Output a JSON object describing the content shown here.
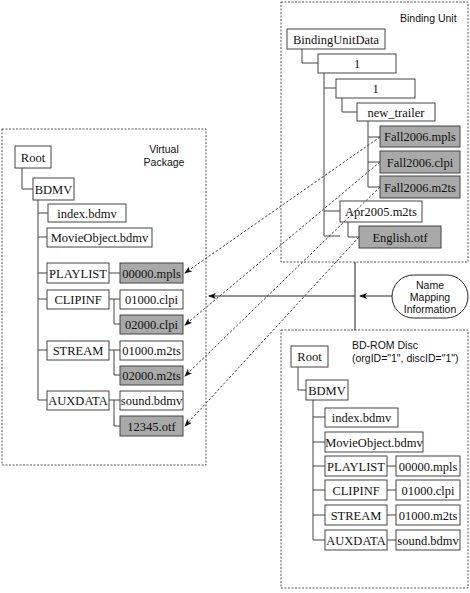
{
  "colors": {
    "shaded_box": "#a9a9a9",
    "plain_box": "#ffffff",
    "line": "#444444"
  },
  "binding_unit": {
    "title": "Binding Unit",
    "nodes": {
      "root": "BindingUnitData",
      "org": "1",
      "disc": "1",
      "dir": "new_trailer",
      "mpls": "Fall2006.mpls",
      "clpi": "Fall2006.clpi",
      "m2ts": "Fall2006.m2ts",
      "apr": "Apr2005.m2ts",
      "otf": "English.otf"
    }
  },
  "virtual_package": {
    "title_line1": "Virtual",
    "title_line2": "Package",
    "nodes": {
      "root": "Root",
      "bdmv": "BDMV",
      "index": "index.bdmv",
      "movieobject": "MovieObject.bdmv",
      "playlist": "PLAYLIST",
      "mpls": "00000.mpls",
      "clipinf": "CLIPINF",
      "clpi1": "01000.clpi",
      "clpi2": "02000.clpi",
      "stream": "STREAM",
      "m2ts1": "01000.m2ts",
      "m2ts2": "02000.m2ts",
      "auxdata": "AUXDATA",
      "sound": "sound.bdmv",
      "otf": "12345.otf"
    }
  },
  "name_mapping": {
    "line1": "Name",
    "line2": "Mapping",
    "line3": "Information"
  },
  "bdrom_disc": {
    "title_line1": "BD-ROM Disc",
    "title_line2": "(orgID=\"1\", discID=\"1\")",
    "nodes": {
      "root": "Root",
      "bdmv": "BDMV",
      "index": "index.bdmv",
      "movieobject": "MovieObject.bdmv",
      "playlist": "PLAYLIST",
      "mpls": "00000.mpls",
      "clipinf": "CLIPINF",
      "clpi": "01000.clpi",
      "stream": "STREAM",
      "m2ts": "01000.m2ts",
      "auxdata": "AUXDATA",
      "sound": "sound.bdmv"
    }
  }
}
